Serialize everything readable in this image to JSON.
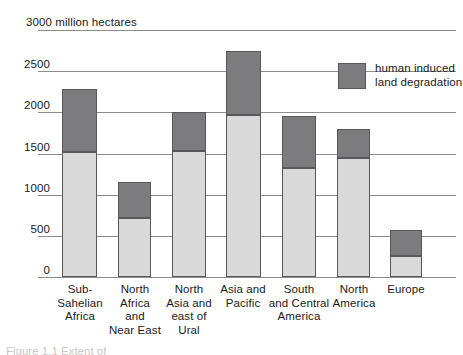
{
  "chart_data": {
    "type": "bar",
    "subtype": "stacked-bar",
    "title": "3000 million hectares",
    "xlabel": "",
    "ylabel": "million hectares",
    "ylim": [
      0,
      3000
    ],
    "yticks": [
      0,
      500,
      1000,
      1500,
      2000,
      2500,
      3000
    ],
    "ytick_labels": [
      "0",
      "500",
      "1000",
      "1500",
      "2000",
      "2500",
      "3000 million hectares"
    ],
    "grid": true,
    "legend_position": "top-right-inside",
    "categories": [
      "Sub-Sahelian Africa",
      "North Africa and Near East",
      "North Asia and east of Ural",
      "Asia and Pacific",
      "South and Central America",
      "North America",
      "Europe"
    ],
    "category_labels_multiline": [
      "Sub-\nSahelian\nAfrica",
      "North\nAfrica\nand\nNear East",
      "North\nAsia and\neast of\nUral",
      "Asia and\nPacific",
      "South\nand Central\nAmerica",
      "North\nAmerica",
      "Europe"
    ],
    "series": [
      {
        "name": "other land",
        "color": "#d9d9d9",
        "values": [
          1520,
          720,
          1530,
          1970,
          1320,
          1450,
          255
        ]
      },
      {
        "name": "human induced land degradation",
        "color": "#7c7c7e",
        "values": [
          760,
          430,
          480,
          780,
          630,
          350,
          315
        ]
      }
    ],
    "totals": [
      2280,
      1150,
      2010,
      2750,
      1950,
      1800,
      570
    ]
  },
  "legend": {
    "entries": [
      {
        "label": "human induced\nland degradation",
        "color": "#7c7c7e"
      }
    ]
  },
  "axis": {
    "title": "3000 million hectares",
    "tick_labels": [
      "2500",
      "2000",
      "1500",
      "1000",
      "500",
      "0"
    ]
  },
  "caption": {
    "fragment": "Figure 1.1  Extent of"
  },
  "colors": {
    "base_fill": "#d9d9d9",
    "degraded_fill": "#7c7c7e",
    "bar_stroke": "#58585a",
    "gridline": "#8d8d8d",
    "text": "#1a1a1a"
  }
}
